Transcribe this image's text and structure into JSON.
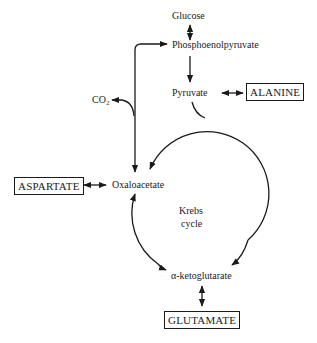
{
  "diagram": {
    "type": "metabolic-pathway",
    "nodes": {
      "glucose": "Glucose",
      "pep": "Phosphoenolpyruvate",
      "pyruvate": "Pyruvate",
      "co2": "CO₂",
      "oxaloacetate": "Oxaloacetate",
      "krebs_line1": "Krebs",
      "krebs_line2": "cycle",
      "akg": "α-ketoglutarate"
    },
    "amino_acids": {
      "alanine": "ALANINE",
      "aspartate": "ASPARTATE",
      "glutamate": "GLUTAMATE"
    },
    "edges": [
      {
        "from": "Glucose",
        "to": "Phosphoenolpyruvate",
        "type": "bidirectional"
      },
      {
        "from": "Phosphoenolpyruvate",
        "to": "Pyruvate",
        "type": "forward"
      },
      {
        "from": "Pyruvate",
        "to": "ALANINE",
        "type": "bidirectional"
      },
      {
        "from": "Oxaloacetate",
        "to": "Phosphoenolpyruvate",
        "type": "forward"
      },
      {
        "from": "Oxaloacetate",
        "to": "CO₂",
        "type": "forward"
      },
      {
        "from": "Pyruvate",
        "to": "Krebs cycle",
        "type": "forward"
      },
      {
        "from": "Krebs cycle",
        "to": "Oxaloacetate",
        "type": "forward"
      },
      {
        "from": "ASPARTATE",
        "to": "Oxaloacetate",
        "type": "bidirectional"
      },
      {
        "from": "Krebs cycle",
        "to": "α-ketoglutarate",
        "type": "forward"
      },
      {
        "from": "α-ketoglutarate",
        "to": "GLUTAMATE",
        "type": "bidirectional"
      }
    ],
    "colors": {
      "ink": "#1a1a1a",
      "background": "#ffffff"
    }
  }
}
